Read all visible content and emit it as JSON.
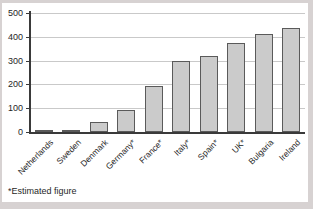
{
  "chart_data": {
    "type": "bar",
    "categories": [
      "Netherlands",
      "Sweden",
      "Denmark",
      "Germany*",
      "France*",
      "Italy*",
      "Spain*",
      "UK*",
      "Bulgaria",
      "Ireland"
    ],
    "values": [
      8,
      10,
      40,
      93,
      195,
      300,
      320,
      375,
      410,
      435
    ],
    "title": "",
    "xlabel": "",
    "ylabel": "",
    "ylim": [
      0,
      500
    ],
    "yticks": [
      0,
      100,
      200,
      300,
      400,
      500
    ],
    "grid": true,
    "legend": "none",
    "footnote": "*Estimated figure",
    "colors": {
      "page_bg": "#d7d2d2",
      "panel_bg": "#ffffff",
      "bar_fill": "#cbcbcb",
      "bar_border": "#5a5a5a",
      "gridline": "#c9c9c9",
      "axis": "#3a3a3a",
      "text": "#1f1f1f"
    }
  }
}
